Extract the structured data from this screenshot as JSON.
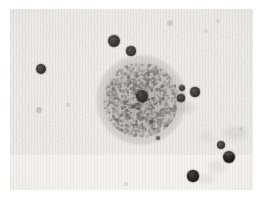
{
  "image": {
    "kind": "micrograph",
    "title": "Grayscale micrograph",
    "description": "Light micrograph showing a single large granular cell near the centre of the field surrounded by numerous small, dense, darkly stained round particles scattered across a pale background.",
    "modality": "brightfield light microscopy print",
    "color_mode": "grayscale",
    "border_color": "#ffffff",
    "background_color": "#f1f0ee",
    "particle_color": "#111111",
    "cell_color": "#8a8885",
    "frame": {
      "x": 10,
      "y": 9,
      "width": 243,
      "height": 181
    },
    "visible_text": "",
    "labels": [],
    "scale_bar": "",
    "annotations": []
  },
  "chart_data": {
    "type": "scatter",
    "xlabel": "",
    "ylabel": "",
    "xlim": [
      0,
      243
    ],
    "ylim": [
      0,
      181
    ],
    "grid": false,
    "legend": "none",
    "cell": {
      "label": "granular cell",
      "cx": 131,
      "cy": 91,
      "r": 38,
      "darkness": 0.42,
      "texture": "mottled / granular cytoplasm"
    },
    "series": [
      {
        "name": "dark particles",
        "points": [
          {
            "cx": 104,
            "cy": 32,
            "r": 6.2,
            "darkness": 0.95
          },
          {
            "cx": 121,
            "cy": 42,
            "r": 4.6,
            "darkness": 0.93
          },
          {
            "cx": 31,
            "cy": 60,
            "r": 5.4,
            "darkness": 0.94
          },
          {
            "cx": 132,
            "cy": 87,
            "r": 6.0,
            "darkness": 0.96
          },
          {
            "cx": 172,
            "cy": 79,
            "r": 3.2,
            "darkness": 0.91
          },
          {
            "cx": 171,
            "cy": 89,
            "r": 3.6,
            "darkness": 0.92
          },
          {
            "cx": 185,
            "cy": 83,
            "r": 4.6,
            "darkness": 0.94
          },
          {
            "cx": 211,
            "cy": 136,
            "r": 4.4,
            "darkness": 0.93
          },
          {
            "cx": 219,
            "cy": 148,
            "r": 6.0,
            "darkness": 0.96
          },
          {
            "cx": 183,
            "cy": 167,
            "r": 5.6,
            "darkness": 0.95
          },
          {
            "cx": 141,
            "cy": 113,
            "r": 2.0,
            "darkness": 0.7
          },
          {
            "cx": 148,
            "cy": 129,
            "r": 2.2,
            "darkness": 0.72
          }
        ]
      },
      {
        "name": "faint specks",
        "points": [
          {
            "cx": 29,
            "cy": 101,
            "r": 2.6,
            "darkness": 0.38
          },
          {
            "cx": 58,
            "cy": 96,
            "r": 1.6,
            "darkness": 0.26
          },
          {
            "cx": 196,
            "cy": 22,
            "r": 2.2,
            "darkness": 0.22
          },
          {
            "cx": 160,
            "cy": 14,
            "r": 2.6,
            "darkness": 0.3
          },
          {
            "cx": 208,
            "cy": 12,
            "r": 1.8,
            "darkness": 0.2
          },
          {
            "cx": 116,
            "cy": 175,
            "r": 1.8,
            "darkness": 0.22
          },
          {
            "cx": 231,
            "cy": 120,
            "r": 2.0,
            "darkness": 0.24
          }
        ]
      },
      {
        "name": "diffuse smudges",
        "points": [
          {
            "cx": 176,
            "cy": 99,
            "rx": 9,
            "ry": 6,
            "darkness": 0.3
          },
          {
            "cx": 226,
            "cy": 124,
            "rx": 12,
            "ry": 7,
            "darkness": 0.26
          },
          {
            "cx": 207,
            "cy": 158,
            "rx": 9,
            "ry": 6,
            "darkness": 0.24
          },
          {
            "cx": 197,
            "cy": 128,
            "rx": 7,
            "ry": 5,
            "darkness": 0.22
          },
          {
            "cx": 196,
            "cy": 170,
            "rx": 8,
            "ry": 5,
            "darkness": 0.2
          }
        ]
      }
    ]
  }
}
